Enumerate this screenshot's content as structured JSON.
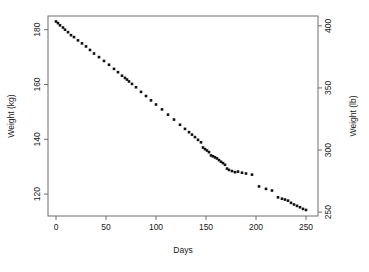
{
  "chart_data": {
    "type": "scatter",
    "title": "",
    "xlabel": "Days",
    "ylabel": "Weight (kg)",
    "y2label": "Weight (lb)",
    "xlim": [
      -8,
      262
    ],
    "ylim": [
      112,
      185
    ],
    "y2lim": [
      246.9,
      407.9
    ],
    "grid": false,
    "legend": "none",
    "xticks": [
      0,
      50,
      100,
      150,
      200,
      250
    ],
    "yticks": [
      120,
      140,
      160,
      180
    ],
    "y2ticks": [
      250,
      300,
      350,
      400
    ],
    "point_marker": "filled-square",
    "point_color": "#111111",
    "series": [
      {
        "name": "weight",
        "x": [
          0,
          2,
          4,
          7,
          9,
          12,
          15,
          18,
          22,
          26,
          30,
          34,
          38,
          43,
          48,
          53,
          58,
          62,
          66,
          69,
          71,
          73,
          76,
          80,
          85,
          90,
          95,
          100,
          106,
          112,
          118,
          124,
          129,
          133,
          136,
          139,
          142,
          145,
          147,
          149,
          151,
          153,
          155,
          157,
          159,
          161,
          163,
          165,
          167,
          169,
          171,
          173,
          176,
          179,
          182,
          186,
          190,
          196,
          203,
          210,
          216,
          222,
          226,
          229,
          232,
          235,
          238,
          241,
          244,
          247,
          250
        ],
        "y": [
          183.0,
          182.4,
          181.6,
          180.8,
          180.0,
          179.1,
          178.0,
          177.3,
          176.1,
          175.0,
          173.9,
          172.6,
          171.3,
          170.0,
          168.6,
          167.2,
          165.7,
          164.5,
          163.2,
          162.4,
          161.8,
          161.1,
          160.2,
          159.0,
          157.3,
          155.8,
          154.2,
          152.7,
          150.9,
          149.0,
          147.2,
          145.3,
          143.8,
          142.6,
          141.7,
          140.8,
          139.8,
          138.9,
          137.0,
          136.4,
          135.9,
          135.3,
          134.1,
          133.8,
          133.4,
          133.0,
          132.4,
          131.8,
          131.3,
          130.7,
          129.3,
          128.8,
          128.4,
          128.0,
          128.2,
          127.8,
          127.5,
          127.1,
          122.8,
          121.9,
          121.3,
          118.8,
          118.3,
          118.0,
          117.6,
          116.8,
          116.2,
          115.7,
          115.2,
          114.6,
          114.2
        ]
      }
    ]
  },
  "geometry": {
    "plot_left": 48,
    "plot_right": 318,
    "plot_top": 16,
    "plot_bottom": 216
  }
}
